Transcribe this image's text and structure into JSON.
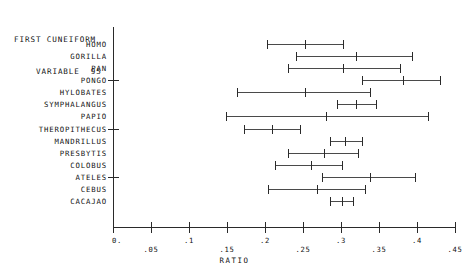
{
  "title": {
    "line1": "FIRST CUNEIFORM",
    "line2": "VARIABLE  95"
  },
  "axis": {
    "x_title": "RATIO",
    "tick_labels": [
      "0.",
      ".05",
      ".1",
      ".15",
      ".2",
      ".25",
      ".3",
      ".35",
      ".4",
      ".45"
    ],
    "tick_values": [
      0,
      0.05,
      0.1,
      0.15,
      0.2,
      0.25,
      0.3,
      0.35,
      0.4,
      0.45
    ]
  },
  "chart_data": {
    "type": "line",
    "title": "FIRST CUNEIFORM VARIABLE  95",
    "xlabel": "RATIO",
    "ylabel": "",
    "xlim": [
      0.0,
      0.45
    ],
    "grid": false,
    "legend": "none",
    "categories": [
      "HOMO",
      "GORILLA",
      "PAN",
      "PONGO",
      "HYLOBATES",
      "SYMPHALANGUS",
      "PAPIO",
      "THEROPITHECUS",
      "MANDRILLUS",
      "PRESBYTIS",
      "COLOBUS",
      "ATELES",
      "CEBUS",
      "CACAJAO"
    ],
    "series": [
      {
        "name": "minimum",
        "values": [
          0.203,
          0.241,
          0.23,
          0.328,
          0.163,
          0.295,
          0.149,
          0.172,
          0.286,
          0.23,
          0.213,
          0.275,
          0.204,
          0.286
        ]
      },
      {
        "name": "mean",
        "values": [
          0.253,
          0.32,
          0.303,
          0.382,
          0.253,
          0.32,
          0.28,
          0.209,
          0.305,
          0.278,
          0.261,
          0.338,
          0.268,
          0.301
        ]
      },
      {
        "name": "maximum",
        "values": [
          0.303,
          0.393,
          0.378,
          0.43,
          0.338,
          0.346,
          0.414,
          0.246,
          0.328,
          0.322,
          0.301,
          0.397,
          0.332,
          0.316
        ]
      }
    ],
    "rows": [
      {
        "label": "HOMO",
        "min": 0.203,
        "mean": 0.253,
        "max": 0.303
      },
      {
        "label": "GORILLA",
        "min": 0.241,
        "mean": 0.32,
        "max": 0.393
      },
      {
        "label": "PAN",
        "min": 0.23,
        "mean": 0.303,
        "max": 0.378
      },
      {
        "label": "PONGO",
        "min": 0.328,
        "mean": 0.382,
        "max": 0.43
      },
      {
        "label": "HYLOBATES",
        "min": 0.163,
        "mean": 0.253,
        "max": 0.338
      },
      {
        "label": "SYMPHALANGUS",
        "min": 0.295,
        "mean": 0.32,
        "max": 0.346
      },
      {
        "label": "PAPIO",
        "min": 0.149,
        "mean": 0.28,
        "max": 0.414
      },
      {
        "label": "THEROPITHECUS",
        "min": 0.172,
        "mean": 0.209,
        "max": 0.246
      },
      {
        "label": "MANDRILLUS",
        "min": 0.286,
        "mean": 0.305,
        "max": 0.328
      },
      {
        "label": "PRESBYTIS",
        "min": 0.23,
        "mean": 0.278,
        "max": 0.322
      },
      {
        "label": "COLOBUS",
        "min": 0.213,
        "mean": 0.261,
        "max": 0.301
      },
      {
        "label": "ATELES",
        "min": 0.275,
        "mean": 0.338,
        "max": 0.397
      },
      {
        "label": "CEBUS",
        "min": 0.204,
        "mean": 0.268,
        "max": 0.332
      },
      {
        "label": "CACAJAO",
        "min": 0.286,
        "mean": 0.301,
        "max": 0.316
      }
    ]
  }
}
